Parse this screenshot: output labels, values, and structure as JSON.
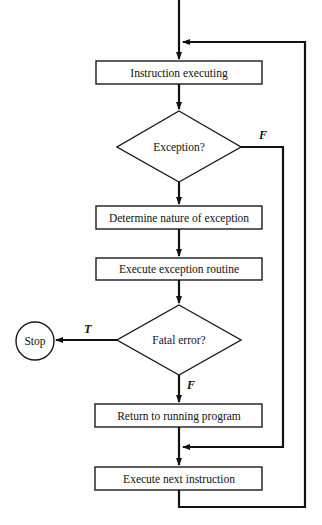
{
  "diagram": {
    "type": "flowchart",
    "nodes": {
      "instruction_executing": "Instruction executing",
      "exception_decision": "Exception?",
      "determine_nature": "Determine nature of exception",
      "execute_routine": "Execute exception routine",
      "fatal_decision": "Fatal error?",
      "stop": "Stop",
      "return_to_program": "Return to running program",
      "execute_next": "Execute next instruction"
    },
    "edge_labels": {
      "exception_false": "F",
      "fatal_true": "T",
      "fatal_false": "F"
    },
    "edges": [
      {
        "from": "instruction_executing",
        "to": "exception_decision"
      },
      {
        "from": "exception_decision",
        "to": "determine_nature",
        "label": ""
      },
      {
        "from": "exception_decision",
        "to": "execute_next",
        "label": "F"
      },
      {
        "from": "determine_nature",
        "to": "execute_routine"
      },
      {
        "from": "execute_routine",
        "to": "fatal_decision"
      },
      {
        "from": "fatal_decision",
        "to": "stop",
        "label": "T"
      },
      {
        "from": "fatal_decision",
        "to": "return_to_program",
        "label": "F"
      },
      {
        "from": "return_to_program",
        "to": "execute_next"
      },
      {
        "from": "execute_next",
        "to": "instruction_executing"
      }
    ]
  }
}
